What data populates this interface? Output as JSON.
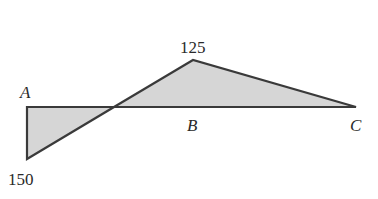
{
  "diagram": {
    "type": "moment-diagram",
    "points": {
      "A": {
        "label": "A"
      },
      "B": {
        "label": "B"
      },
      "C": {
        "label": "C"
      }
    },
    "values": {
      "left_extreme": "150",
      "peak": "125"
    },
    "colors": {
      "fill": "#d6d6d6",
      "stroke": "#3a3a3a",
      "text": "#2a2a2a"
    }
  }
}
